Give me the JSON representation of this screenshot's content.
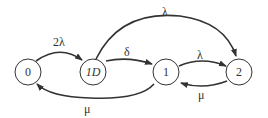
{
  "diagram": {
    "type": "state-transition",
    "nodes": [
      {
        "id": "0",
        "label": "0"
      },
      {
        "id": "1D",
        "label": "1D"
      },
      {
        "id": "1",
        "label": "1"
      },
      {
        "id": "2",
        "label": "2"
      }
    ],
    "edges": [
      {
        "from": "0",
        "to": "1D",
        "label": "2λ"
      },
      {
        "from": "1D",
        "to": "1",
        "label": "δ"
      },
      {
        "from": "1D",
        "to": "2",
        "label": "λ"
      },
      {
        "from": "1",
        "to": "2",
        "label": "λ"
      },
      {
        "from": "2",
        "to": "1",
        "label": "μ"
      },
      {
        "from": "1",
        "to": "0",
        "label": "μ"
      }
    ]
  }
}
